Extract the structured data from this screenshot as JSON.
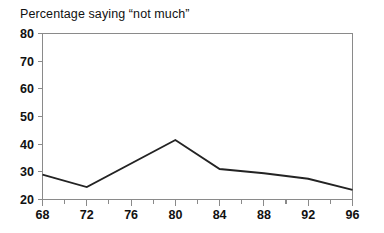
{
  "chart_data": {
    "type": "line",
    "title": "Percentage saying “not much”",
    "xlabel": "",
    "ylabel": "",
    "xlim": [
      68,
      96
    ],
    "ylim": [
      20,
      80
    ],
    "grid": false,
    "legend": null,
    "x_major_ticks": [
      68,
      72,
      76,
      80,
      84,
      88,
      92,
      96
    ],
    "x_minor_ticks": [
      70,
      74,
      78,
      82,
      86,
      90,
      94
    ],
    "y_ticks": [
      20,
      30,
      40,
      50,
      60,
      70,
      80
    ],
    "x_tick_labels": [
      "68",
      "72",
      "76",
      "80",
      "84",
      "88",
      "92",
      "96"
    ],
    "y_tick_labels": [
      "20",
      "30",
      "40",
      "50",
      "60",
      "70",
      "80"
    ],
    "series": [
      {
        "name": "Percentage saying “not much”",
        "color": "#232323",
        "x": [
          68,
          72,
          80,
          84,
          88,
          92,
          96
        ],
        "values": [
          29,
          24.5,
          41.5,
          31,
          29.5,
          27.5,
          23.5
        ]
      }
    ]
  },
  "figure": {
    "background_color": "#ffffff",
    "axis_color": "#8a8a8a",
    "text_color": "#111111"
  }
}
